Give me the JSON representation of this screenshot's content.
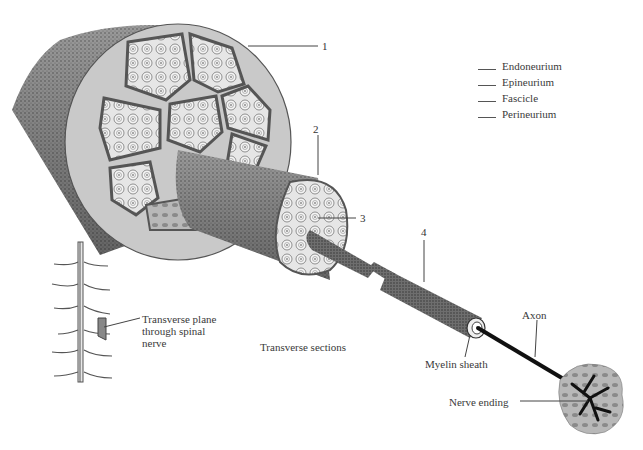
{
  "figure": {
    "numbered_callouts": [
      "1",
      "2",
      "3",
      "4"
    ],
    "legend": {
      "instruction": "Match terms to numbered callouts",
      "items": [
        {
          "label": "Endoneurium"
        },
        {
          "label": "Epineurium"
        },
        {
          "label": "Fascicle"
        },
        {
          "label": "Perineurium"
        }
      ]
    },
    "labels": {
      "transverse_plane": [
        "Transverse plane",
        "through spinal",
        "nerve"
      ],
      "transverse_sections": "Transverse sections",
      "myelin_sheath": "Myelin sheath",
      "axon": "Axon",
      "nerve_ending": "Nerve ending"
    },
    "colors": {
      "ink": "#333333",
      "stipple_dark": "#555555",
      "stipple_mid": "#8a8a8a",
      "light_fill": "#d8d8d8",
      "background": "#ffffff",
      "axon": "#111111"
    }
  }
}
